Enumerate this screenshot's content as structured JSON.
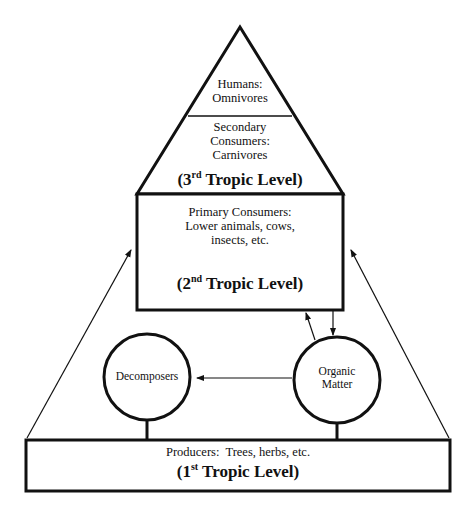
{
  "diagram": {
    "type": "trophic-pyramid",
    "apex": {
      "line1": "Humans:",
      "line2": "Omnivores"
    },
    "third_level": {
      "line1": "Secondary",
      "line2": "Consumers:",
      "line3": "Carnivores",
      "level_prefix": "(3",
      "level_sup": "rd",
      "level_suffix": " Tropic Level)"
    },
    "second_level": {
      "line1": "Primary Consumers:",
      "line2": "Lower animals, cows,",
      "line3": "insects, etc.",
      "level_prefix": "(2",
      "level_sup": "nd",
      "level_suffix": " Tropic Level)"
    },
    "decomposers": {
      "label": "Decomposers"
    },
    "organic_matter": {
      "line1": "Organic",
      "line2": "Matter"
    },
    "first_level": {
      "line1": "Producers:  Trees, herbs, etc.",
      "level_prefix": "(1",
      "level_sup": "st",
      "level_suffix": " Tropic Level)"
    },
    "connections": [
      {
        "from": "first_level",
        "to": "second_level",
        "side": "left"
      },
      {
        "from": "first_level",
        "to": "second_level",
        "side": "right"
      },
      {
        "from": "second_level",
        "to": "organic_matter"
      },
      {
        "from": "organic_matter",
        "to": "second_level"
      },
      {
        "from": "organic_matter",
        "to": "decomposers"
      }
    ],
    "colors": {
      "stroke": "#111111",
      "background": "#ffffff"
    }
  }
}
